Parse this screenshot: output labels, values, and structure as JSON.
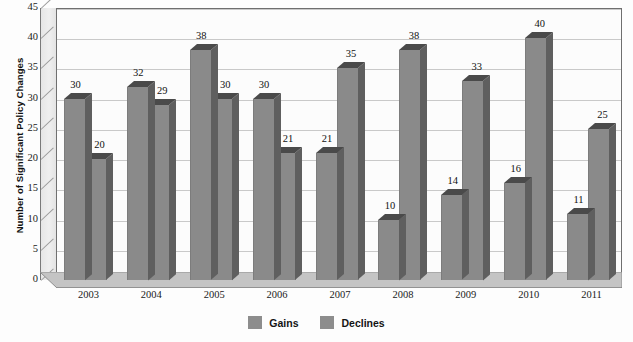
{
  "chart_data": {
    "type": "bar",
    "title": "",
    "xlabel": "",
    "ylabel": "Number of Significant Policy Changes",
    "categories": [
      "2003",
      "2004",
      "2005",
      "2006",
      "2007",
      "2008",
      "2009",
      "2010",
      "2011"
    ],
    "series": [
      {
        "name": "Gains",
        "values": [
          30,
          32,
          38,
          30,
          21,
          10,
          14,
          16,
          11
        ],
        "color": "#8a8a8a"
      },
      {
        "name": "Declines",
        "values": [
          20,
          29,
          30,
          21,
          35,
          38,
          33,
          40,
          25
        ],
        "color": "#8a8a8a"
      }
    ],
    "ylim": [
      0,
      45
    ],
    "ytick_step": 5,
    "yticks": [
      "0",
      "5",
      "10",
      "15",
      "20",
      "25",
      "30",
      "35",
      "40",
      "45"
    ],
    "grid": true,
    "legend_position": "bottom",
    "style": "3d-column",
    "data_labels": true
  },
  "axis": {
    "y_title": "Number of Significant Policy Changes"
  },
  "legend": {
    "items": [
      {
        "label": "Gains",
        "color": "#8d8d8d"
      },
      {
        "label": "Declines",
        "color": "#8d8d8d"
      }
    ]
  },
  "colors": {
    "bar_front": "#8a8a8a",
    "bar_side": "#5f5f5f",
    "bar_top": "#4a4a4a",
    "plot_background": "#fcfcfc",
    "gridline": "#c9c9c9",
    "frame": "#6f6f6f",
    "wall": "#e9e9e9",
    "floor": "#bdbdbd"
  }
}
